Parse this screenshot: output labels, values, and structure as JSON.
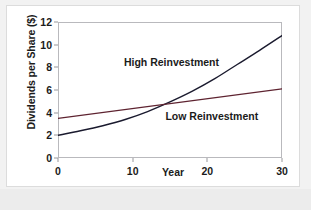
{
  "chart_data": {
    "type": "line",
    "title": "",
    "xlabel": "Year",
    "ylabel": "Dividends per Share ($)",
    "xlim": [
      0,
      30
    ],
    "ylim": [
      0,
      12
    ],
    "xticks": [
      "0",
      "10",
      "20",
      "30"
    ],
    "xtick_values": [
      0,
      10,
      20,
      30
    ],
    "yticks": [
      "0",
      "2",
      "4",
      "6",
      "8",
      "10",
      "12"
    ],
    "ytick_values": [
      0,
      2,
      4,
      6,
      8,
      10,
      12
    ],
    "grid": false,
    "legend_position": "inline-annotations",
    "series": [
      {
        "name": "High Reinvestment",
        "color": "#1a1a2e",
        "x": [
          0,
          3,
          6,
          9,
          12,
          15,
          18,
          21,
          24,
          27,
          30
        ],
        "values": [
          2.0,
          2.4,
          2.85,
          3.4,
          4.1,
          4.95,
          5.9,
          7.0,
          8.25,
          9.5,
          10.8
        ],
        "annotation": "High Reinvestment",
        "annotation_x": 15.2,
        "annotation_y": 8.45
      },
      {
        "name": "Low Reinvestment",
        "color": "#5e2330",
        "x": [
          0,
          30
        ],
        "values": [
          3.5,
          6.1
        ],
        "annotation": "Low Reinvestment",
        "annotation_x": 20.6,
        "annotation_y": 3.7
      }
    ],
    "crossing_point": {
      "x": 13.5,
      "y": 4.65
    }
  },
  "colors": {
    "page_background": "#f2f2f2",
    "card_background": "#ffffff",
    "card_border": "#dcdcdc",
    "axis_frame": "#b9b9bd",
    "text": "#1b1b1b",
    "high_reinvestment": "#1a1a2e",
    "low_reinvestment": "#5e2330"
  }
}
